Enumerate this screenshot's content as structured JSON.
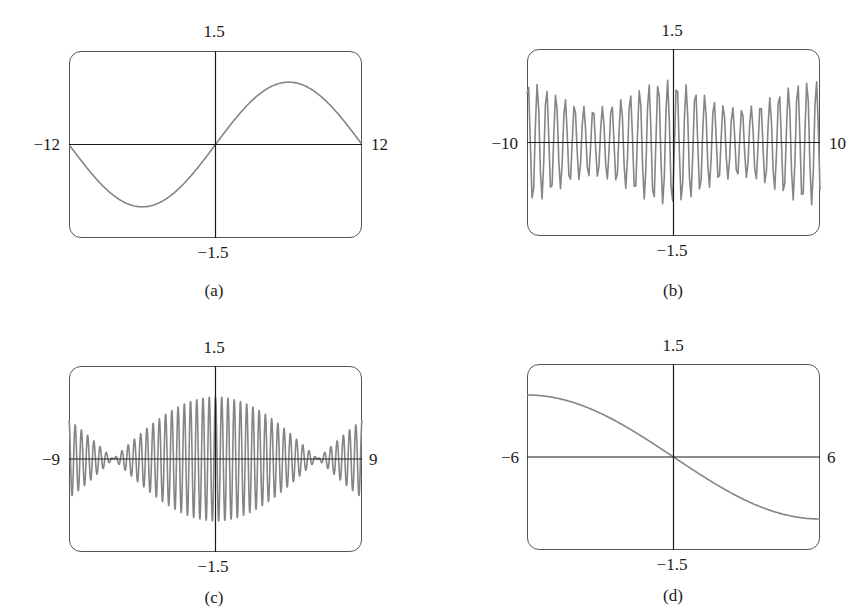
{
  "figure": {
    "panels": [
      {
        "id": "a",
        "caption": "(a)",
        "ymax_label": "1.5",
        "ymin_label": "-1.5",
        "xmin_label": "-12",
        "xmax_label": "12"
      },
      {
        "id": "b",
        "caption": "(b)",
        "ymax_label": "1.5",
        "ymin_label": "-1.5",
        "xmin_label": "-10",
        "xmax_label": "10"
      },
      {
        "id": "c",
        "caption": "(c)",
        "ymax_label": "1.5",
        "ymin_label": "-1.5",
        "xmin_label": "-9",
        "xmax_label": "9"
      },
      {
        "id": "d",
        "caption": "(d)",
        "ymax_label": "1.5",
        "ymin_label": "-1.5",
        "xmin_label": "-6",
        "xmax_label": "6"
      }
    ]
  },
  "colors": {
    "curve": "#858585",
    "axes": "#1a1a1a",
    "frame": "#555555"
  },
  "chart_data": [
    {
      "type": "line",
      "title": "(a)",
      "xlim": [
        -12,
        12
      ],
      "ylim": [
        -1.5,
        1.5
      ],
      "xlabel": "",
      "ylabel": "",
      "tick_labels": {
        "x": [
          "-12",
          "12"
        ],
        "y": [
          "-1.5",
          "1.5"
        ]
      },
      "grid": false,
      "description": "single sine period: y = sin(pi*x/12)",
      "x": [
        -12,
        -9,
        -6,
        -3,
        0,
        3,
        6,
        9,
        12
      ],
      "y": [
        0,
        -0.71,
        -1,
        -0.71,
        0,
        0.71,
        1,
        0.71,
        0
      ]
    },
    {
      "type": "line",
      "title": "(b)",
      "xlim": [
        -10,
        10
      ],
      "ylim": [
        -1.5,
        1.5
      ],
      "xlabel": "",
      "ylabel": "",
      "tick_labels": {
        "x": [
          "-10",
          "10"
        ],
        "y": [
          "-1.5",
          "1.5"
        ]
      },
      "grid": false,
      "description": "aliased high-frequency oscillation, ~32 visible peaks, amplitude about 0.55-1.0 with beat pattern",
      "approx_cycles_visible": 32,
      "amplitude_range": [
        0.55,
        1.0
      ]
    },
    {
      "type": "line",
      "title": "(c)",
      "xlim": [
        -9,
        9
      ],
      "ylim": [
        -1.5,
        1.5
      ],
      "xlabel": "",
      "ylabel": "",
      "tick_labels": {
        "x": [
          "-9",
          "9"
        ],
        "y": [
          "-1.5",
          "1.5"
        ]
      },
      "grid": false,
      "description": "amplitude-modulated oscillation, envelope |cos(x/4)|, max amplitude 1 at x=0, nodes near x=±6.3, ~47 carrier cycles",
      "envelope_x": [
        -9,
        -6.3,
        0,
        6.3,
        9
      ],
      "envelope_y": [
        0.63,
        0,
        1.0,
        0,
        0.63
      ],
      "approx_cycles_visible": 47
    },
    {
      "type": "line",
      "title": "(d)",
      "xlim": [
        -6,
        6
      ],
      "ylim": [
        -1.5,
        1.5
      ],
      "xlabel": "",
      "ylabel": "",
      "tick_labels": {
        "x": [
          "-6",
          "6"
        ],
        "y": [
          "-1.5",
          "1.5"
        ]
      },
      "grid": false,
      "description": "half period decreasing sine: y = -sin(pi*x/12)",
      "x": [
        -6,
        -4,
        -2,
        0,
        2,
        4,
        6
      ],
      "y": [
        1,
        0.87,
        0.5,
        0,
        -0.5,
        -0.87,
        -1
      ]
    }
  ]
}
